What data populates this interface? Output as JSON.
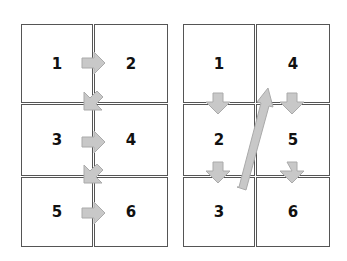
{
  "diagrams": [
    {
      "name": "left-grid-row-major",
      "cells": [
        "1",
        "2",
        "3",
        "4",
        "5",
        "6"
      ],
      "reading_order": "row-major (left-to-right, then down)",
      "arrows": [
        "1→2",
        "2→3",
        "3→4",
        "4→5",
        "5→6"
      ]
    },
    {
      "name": "right-grid-column-major",
      "cells": [
        "1",
        "4",
        "2",
        "5",
        "3",
        "6"
      ],
      "reading_order": "column-major (top-to-bottom, then next column)",
      "arrows": [
        "1→2",
        "2→3",
        "3→4",
        "4→5",
        "5→6"
      ]
    }
  ],
  "colors": {
    "border": "#555555",
    "arrow_fill": "#c8c8c8",
    "arrow_stroke": "#aaaaaa"
  }
}
